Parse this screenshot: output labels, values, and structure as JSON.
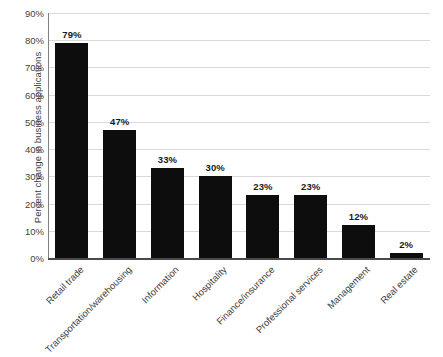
{
  "chart_data": {
    "type": "bar",
    "title": "",
    "xlabel": "",
    "ylabel": "Percent change in business applications",
    "ylim": [
      0,
      90
    ],
    "ytick_step": 10,
    "grid": true,
    "legend": false,
    "categories": [
      "Retail trade",
      "Transportation/warehousing",
      "Information",
      "Hospitality",
      "Finance/insurance",
      "Professional services",
      "Management",
      "Real estate"
    ],
    "values": [
      79,
      47,
      33,
      30,
      23,
      23,
      12,
      2
    ],
    "value_labels": [
      "79%",
      "47%",
      "33%",
      "30%",
      "23%",
      "23%",
      "12%",
      "2%"
    ],
    "ytick_labels": [
      "0%",
      "10%",
      "20%",
      "30%",
      "40%",
      "50%",
      "60%",
      "70%",
      "80%",
      "90%"
    ],
    "bar_color": "#0d0d0d",
    "gridline_color": "#d9d9d9",
    "axis_color": "#4a4a4a"
  }
}
